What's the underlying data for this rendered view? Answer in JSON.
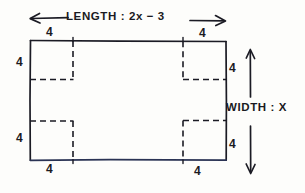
{
  "diagram": {
    "length_label": "LENGTH : 2x − 3",
    "width_label": "WIDTH : X",
    "corner_value": "4",
    "ink_color": "#1b1b24",
    "bottom_edge_color": "#2a3354",
    "background": "#fdfdfb",
    "corner_labels": {
      "top_left_top": "4",
      "top_left_side": "4",
      "top_right_top": "4",
      "top_right_side": "4",
      "bottom_left_side": "4",
      "bottom_left_bottom": "4",
      "bottom_right_side": "4",
      "bottom_right_bottom": "4"
    },
    "geometry": {
      "rect_left": 30,
      "rect_top": 40,
      "rect_right": 226,
      "rect_bottom": 160,
      "square_size": 43,
      "length_arrow_y": 18,
      "width_arrow_x": 250
    }
  }
}
